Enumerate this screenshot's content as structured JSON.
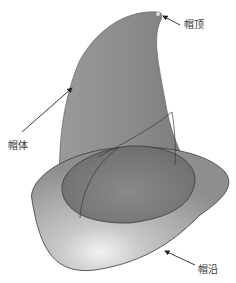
{
  "diagram": {
    "type": "hat-3d-model",
    "labels": {
      "top": "帽顶",
      "body": "帽体",
      "brim": "帽沿"
    },
    "colors": {
      "surface": "#8a8a8a",
      "surface_light": "#bdbdbd",
      "outline": "#3a3a3a",
      "arrow": "#222222",
      "background": "#ffffff"
    }
  }
}
